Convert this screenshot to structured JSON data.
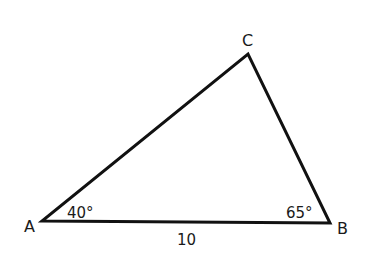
{
  "diagram": {
    "type": "triangle",
    "vertices": {
      "A": {
        "label": "A",
        "x": 42,
        "y": 221
      },
      "B": {
        "label": "B",
        "x": 330,
        "y": 223
      },
      "C": {
        "label": "C",
        "x": 248,
        "y": 54
      }
    },
    "angles": {
      "A": "40°",
      "B": "65°"
    },
    "sides": {
      "AB": "10"
    },
    "colors": {
      "stroke": "#111111",
      "text": "#1a1a1a",
      "background": "#ffffff"
    }
  }
}
